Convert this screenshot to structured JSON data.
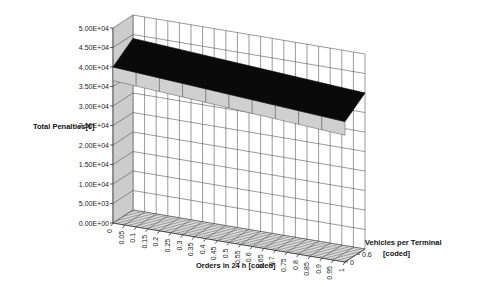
{
  "chart_data": {
    "type": "surface3d",
    "title": "",
    "zlabel": "Total Penalties[€]",
    "xlabel": "Orders in 24 h [coded]",
    "ylabel": "Vehicles per Terminal [coded]",
    "z_ticks": [
      "0.00E+00",
      "5.00E+03",
      "1.00E+04",
      "1.50E+04",
      "2.00E+04",
      "2.50E+04",
      "3.00E+04",
      "3.50E+04",
      "4.00E+04",
      "4.50E+04",
      "5.00E+04"
    ],
    "zlim": [
      0,
      50000
    ],
    "x_ticks": [
      "0",
      "0.05",
      "0.1",
      "0.15",
      "0.2",
      "0.25",
      "0.3",
      "0.35",
      "0.4",
      "0.45",
      "0.5",
      "0.55",
      "0.6",
      "0.65",
      "0.7",
      "0.75",
      "0.8",
      "0.85",
      "0.9",
      "0.95",
      "1"
    ],
    "y_ticks": [
      "0",
      "0.6"
    ],
    "surface": {
      "description": "Nearly flat plane, slightly decreasing with Orders; dark top surface, light gray underside visible at front",
      "corner_values": [
        {
          "orders": 0,
          "vehicles": 0,
          "penalty": 40000
        },
        {
          "orders": 0,
          "vehicles": 1,
          "penalty": 44000
        },
        {
          "orders": 1,
          "vehicles": 0,
          "penalty": 36000
        },
        {
          "orders": 1,
          "vehicles": 1,
          "penalty": 40000
        }
      ]
    },
    "colors": {
      "surface_top": "#0a0a0a",
      "surface_bottom": "#d0d0d0",
      "grid": "#555555"
    }
  }
}
